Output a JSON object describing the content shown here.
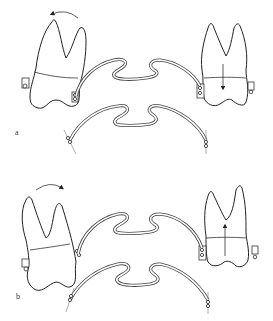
{
  "figure": {
    "type": "dental orthodontic diagram",
    "panels": [
      {
        "label": "a",
        "left_tooth": {
          "rotation_arrow": "counterclockwise"
        },
        "right_tooth": {
          "force_arrow": "down"
        }
      },
      {
        "label": "b",
        "left_tooth": {
          "rotation_arrow": "clockwise"
        },
        "right_tooth": {
          "force_arrow": "up"
        }
      }
    ]
  }
}
